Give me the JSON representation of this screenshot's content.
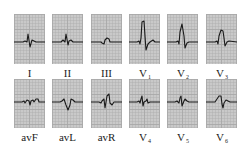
{
  "figure": {
    "grid_color": "#c9c9c9",
    "grid_line_color": "#a8a8a8",
    "trace_color": "#1a1a1a"
  },
  "rows": [
    {
      "leads": [
        {
          "name": "I",
          "main": "I",
          "sub": ""
        },
        {
          "name": "II",
          "main": "II",
          "sub": ""
        },
        {
          "name": "III",
          "main": "III",
          "sub": ""
        },
        {
          "name": "V1",
          "main": "V",
          "sub": "1"
        },
        {
          "name": "V2",
          "main": "V",
          "sub": "2"
        },
        {
          "name": "V3",
          "main": "V",
          "sub": "3"
        }
      ]
    },
    {
      "leads": [
        {
          "name": "avF",
          "main": "avF",
          "sub": ""
        },
        {
          "name": "avL",
          "main": "avL",
          "sub": ""
        },
        {
          "name": "avR",
          "main": "avR",
          "sub": ""
        },
        {
          "name": "V4",
          "main": "V",
          "sub": "4"
        },
        {
          "name": "V5",
          "main": "V",
          "sub": "5"
        },
        {
          "name": "V6",
          "main": "V",
          "sub": "6"
        }
      ]
    }
  ],
  "waveforms": {
    "I": "0,28 9,28 11,27 13,28 14,20 16,33 18,26 20,27 22,28 31,28",
    "II": "0,28 9,28 11,26 13,28 14,20 16,31 17,27 19,26 21,28 31,28",
    "III": "0,28 10,28 11,29 13,30 14,26 16,24 18,25 19,28 31,28",
    "V1": "0,28 8,28 10,27 11,30 12,24 13,8 15,7 16,22 17,36 19,30 21,28 24,26 26,28 31,28",
    "V2": "0,28 9,28 11,27 12,30 13,18 15,10 17,22 18,34 20,29 22,28 31,28",
    "V3": "0,28 9,28 11,27 12,30 13,22 15,16 17,17 18,24 19,32 21,28 23,27 31,28",
    "avF": "0,23 8,23 10,22 11,24 13,21 15,22 16,26 17,22 19,21 20,23 22,20 24,20 25,23 31,23",
    "avL": "0,23 8,23 10,22 12,20 14,26 16,31 18,26 19,20 21,21 23,23 31,23",
    "avR": "0,23 8,23 10,24 11,22 13,20 14,29 16,17 18,15 19,24 21,26 23,23 31,23",
    "V4": "0,23 8,23 10,22 11,24 12,20 13,17 14,27 15,23 17,22 18,20 19,24 21,23 31,23",
    "V5": "0,23 8,23 10,22 12,24 13,19 14,17 15,27 17,22 18,20 20,22 22,23 31,23",
    "V6": "0,23 7,23 9,23 11,20 13,17 15,17 16,25 17,29 18,24 20,21 22,22 24,23 31,23"
  }
}
